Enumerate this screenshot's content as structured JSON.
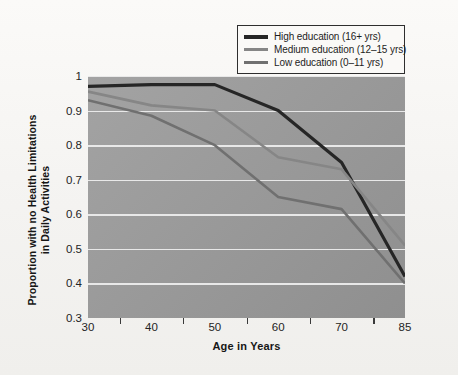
{
  "figure": {
    "background_color": "#f6f5f3",
    "plot_background_color": "#9a9a9a",
    "gridline_color": "#efefef"
  },
  "chart_data": {
    "type": "line",
    "title": "",
    "xlabel": "Age in Years",
    "ylabel": "Proportion with no Health Limitations in Daily Activities",
    "ylabel_line1": "Proportion with no Health Limitations",
    "ylabel_line2": "in Daily Activities",
    "x": [
      30,
      40,
      50,
      60,
      70,
      85
    ],
    "x_tick_labels": [
      "30",
      "40",
      "50",
      "60",
      "70",
      "85"
    ],
    "y_tick_labels": [
      "1",
      "0.9",
      "0.8",
      "0.7",
      "0.6",
      "0.5",
      "0.4",
      "0.3"
    ],
    "y_ticks": [
      1,
      0.9,
      0.8,
      0.7,
      0.6,
      0.5,
      0.4,
      0.3
    ],
    "xlim": [
      30,
      85
    ],
    "ylim": [
      0.3,
      1
    ],
    "grid": "horizontal",
    "legend_position": "top-right",
    "series": [
      {
        "name": "High education (16+ yrs)",
        "color": "#262626",
        "width": 3.2,
        "values": [
          0.97,
          0.975,
          0.975,
          0.9,
          0.75,
          0.42
        ]
      },
      {
        "name": "Medium education (12–15 yrs)",
        "color": "#868686",
        "width": 2.6,
        "values": [
          0.955,
          0.915,
          0.9,
          0.765,
          0.73,
          0.51
        ]
      },
      {
        "name": "Low education (0–11 yrs)",
        "color": "#707070",
        "width": 2.6,
        "values": [
          0.93,
          0.885,
          0.8,
          0.65,
          0.615,
          0.4
        ]
      }
    ]
  },
  "legend": {
    "entries": [
      {
        "label": "High education (16+ yrs)",
        "color": "#262626"
      },
      {
        "label": "Medium education (12–15 yrs)",
        "color": "#868686"
      },
      {
        "label": "Low education (0–11 yrs)",
        "color": "#707070"
      }
    ]
  }
}
